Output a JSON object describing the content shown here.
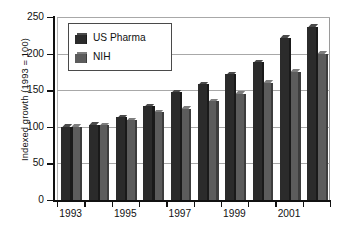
{
  "chart_data": {
    "type": "bar",
    "title": "",
    "subtitle": "",
    "xlabel": "",
    "ylabel": "Indexed growth (1993 = 100)",
    "ylim": [
      0,
      250
    ],
    "ytick_labels": [
      "0",
      "50",
      "100",
      "150",
      "200",
      "250"
    ],
    "ytick_values": [
      0,
      50,
      100,
      150,
      200,
      250
    ],
    "grid": "horizontal",
    "legend_position": "top-left-inside",
    "categories": [
      "1993",
      "1994",
      "1995",
      "1996",
      "1997",
      "1998",
      "1999",
      "2000",
      "2001",
      "2002"
    ],
    "xtick_labels": [
      "1993",
      "1995",
      "1997",
      "1999",
      "2001"
    ],
    "xtick_label_categories": [
      "1993",
      "1995",
      "1997",
      "1999",
      "2001"
    ],
    "series": [
      {
        "name": "US Pharma",
        "color": "#2b2b2b",
        "values": [
          100,
          103,
          113,
          128,
          147,
          158,
          172,
          188,
          222,
          237
        ]
      },
      {
        "name": "NIH",
        "color": "#5c5c5c",
        "values": [
          100,
          102,
          109,
          120,
          125,
          135,
          145,
          160,
          175,
          200
        ]
      }
    ]
  }
}
